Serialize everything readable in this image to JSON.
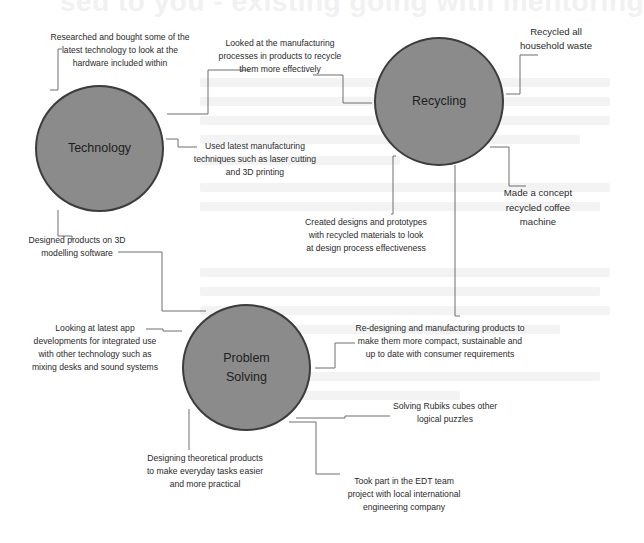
{
  "ghost_header": "sed to you - existing going with mentoring",
  "hubs": {
    "technology": {
      "label": "Technology",
      "fill": "#8b8b8b",
      "border": "#3c3c3c"
    },
    "recycling": {
      "label": "Recycling",
      "fill": "#8b8b8b",
      "border": "#3c3c3c"
    },
    "problem_solving": {
      "label_line1": "Problem",
      "label_line2": "Solving",
      "fill": "#8b8b8b",
      "border": "#3c3c3c"
    }
  },
  "notes": {
    "tech_research": [
      "Researched and bought some of the",
      "latest technology to look at the",
      "hardware included within"
    ],
    "recycle_processes": [
      "Looked at the manufacturing",
      "processes in products to recycle",
      "them more effectively"
    ],
    "recycled_waste": [
      "Recycled all",
      "household waste"
    ],
    "tech_manufacturing": [
      "Used latest manufacturing",
      "techniques such as laser cutting",
      "and 3D printing"
    ],
    "coffee_machine": [
      "Made a concept",
      "recycled coffee",
      "machine"
    ],
    "recycled_prototypes": [
      "Created designs and prototypes",
      "with recycled materials to look",
      "at design process effectiveness"
    ],
    "modelling_3d": [
      "Designed products on 3D",
      "modelling software"
    ],
    "app_developments": [
      "Looking at latest app",
      "developments for integrated use",
      "with other technology such as",
      "mixing desks and sound systems"
    ],
    "redesigning": [
      "Re-designing and manufacturing products to",
      "make them more compact, sustainable and",
      "up to date with consumer requirements"
    ],
    "rubiks": [
      "Solving Rubiks cubes other",
      "logical puzzles"
    ],
    "theoretical_products": [
      "Designing theoretical products",
      "to make everyday tasks easier",
      "and more practical"
    ],
    "edt_project": [
      "Took part in the EDT team",
      "project with local international",
      "engineering company"
    ]
  }
}
